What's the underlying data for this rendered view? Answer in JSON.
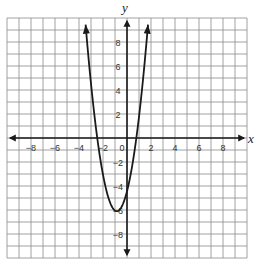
{
  "chart_data": {
    "type": "line",
    "title": "",
    "xlabel": "x",
    "ylabel": "y",
    "xlim": [
      -10,
      10
    ],
    "ylim": [
      -10,
      10
    ],
    "grid": true,
    "grid_step": 1,
    "x_ticks": [
      -8,
      -6,
      -4,
      -2,
      0,
      2,
      4,
      6,
      8
    ],
    "y_ticks": [
      8,
      6,
      4,
      2,
      -2,
      -4,
      -6,
      -8
    ],
    "x_tick_labels": [
      "−8",
      "−6",
      "−4",
      "−2",
      "0",
      "2",
      "4",
      "6",
      "8"
    ],
    "y_tick_labels": [
      "8",
      "6",
      "4",
      "2",
      "−2",
      "−4",
      "−6",
      "−8"
    ],
    "series": [
      {
        "name": "parabola",
        "kind": "quadratic",
        "vertex": [
          -0.85,
          -6.1
        ],
        "a": 2.3,
        "x_intercepts": [
          -2.5,
          0.8
        ],
        "y_intercept": -4.4,
        "x_range": [
          -3.45,
          1.75
        ],
        "arrows_both_ends": true,
        "points": [
          [
            -3.45,
            9.45
          ],
          [
            -3.0,
            4.5
          ],
          [
            -2.5,
            0.2
          ],
          [
            -2.0,
            -3.1
          ],
          [
            -1.5,
            -5.1
          ],
          [
            -0.85,
            -6.1
          ],
          [
            0.0,
            -4.4
          ],
          [
            0.5,
            -1.9
          ],
          [
            1.0,
            1.8
          ],
          [
            1.5,
            6.6
          ],
          [
            1.75,
            9.45
          ]
        ]
      }
    ],
    "legend": null
  },
  "style": {
    "grid_color": "#8a8a8a",
    "axis_color": "#1a1a1a",
    "curve_color": "#1a1a1a",
    "background": "#ffffff"
  },
  "labels": {
    "x_axis": "x",
    "y_axis": "y",
    "origin": "0"
  }
}
